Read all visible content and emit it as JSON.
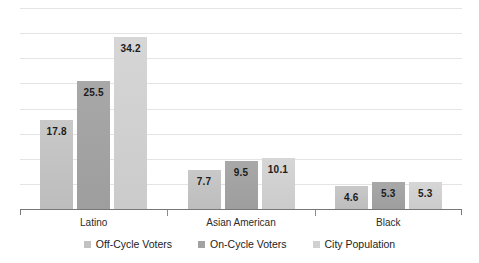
{
  "chart_data": {
    "type": "bar",
    "title": "",
    "subtitle": "",
    "xlabel": "",
    "ylabel": "",
    "categories": [
      "Latino",
      "Asian American",
      "Black"
    ],
    "series": [
      {
        "name": "Off-Cycle Voters",
        "color": "#c2c2c2",
        "values": [
          17.8,
          7.7,
          4.6
        ]
      },
      {
        "name": "On-Cycle Voters",
        "color": "#a2a2a2",
        "values": [
          25.5,
          9.5,
          5.3
        ]
      },
      {
        "name": "City Population",
        "color": "#d0d0d0",
        "values": [
          34.2,
          10.1,
          5.3
        ]
      }
    ],
    "ylim": [
      0,
      40
    ],
    "ytick_labels": [],
    "gridlines": {
      "visible": true,
      "count": 8,
      "color": "#e4e4e4"
    },
    "legend_position": "bottom",
    "data_labels": {
      "visible": true,
      "values": [
        [
          "17.8",
          "7.7",
          "4.6"
        ],
        [
          "25.5",
          "9.5",
          "5.3"
        ],
        [
          "34.2",
          "10.1",
          "5.3"
        ]
      ]
    },
    "axis": {
      "color": "#777777",
      "ticks_visible": true
    }
  },
  "legend": {
    "items": [
      {
        "label": "Off-Cycle Voters",
        "swatch": "legend-swatch-off-cycle"
      },
      {
        "label": "On-Cycle Voters",
        "swatch": "legend-swatch-on-cycle"
      },
      {
        "label": "City Population",
        "swatch": "legend-swatch-city-population"
      }
    ]
  }
}
